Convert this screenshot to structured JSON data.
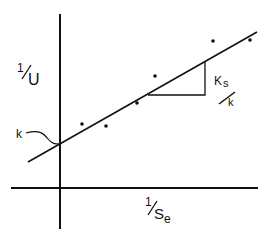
{
  "diagram": {
    "type": "linear-plot",
    "title": "",
    "y_axis": {
      "numerator": "1",
      "denominator": "U",
      "label": "1/U"
    },
    "x_axis": {
      "numerator": "1",
      "denominator": "S",
      "subscript": "e",
      "label": "1/Se"
    },
    "intercept_label": "k",
    "slope_label": {
      "numerator": "K",
      "numerator_sub": "s",
      "denominator": "k",
      "label": "Ks/k"
    },
    "colors": {
      "ink": "#111111",
      "background": "#ffffff"
    }
  },
  "chart_data": {
    "type": "scatter",
    "title": "",
    "xlabel": "1/Se",
    "ylabel": "1/U",
    "grid": false,
    "legend": null,
    "points": [
      {
        "x": 82,
        "y": 124
      },
      {
        "x": 106,
        "y": 126
      },
      {
        "x": 137,
        "y": 103
      },
      {
        "x": 155,
        "y": 76
      },
      {
        "x": 213,
        "y": 41
      },
      {
        "x": 250,
        "y": 40
      }
    ],
    "fit_line": {
      "x1": 28,
      "y1": 162,
      "x2": 257,
      "y2": 32
    },
    "annotations": [
      {
        "text": "k",
        "meaning": "y-intercept"
      },
      {
        "text": "Ks/k",
        "meaning": "slope"
      }
    ]
  }
}
